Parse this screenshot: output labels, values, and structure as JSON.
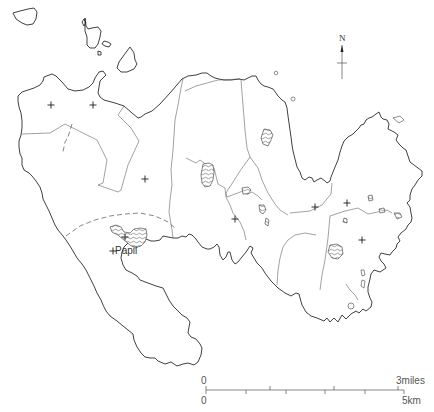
{
  "map": {
    "type": "outline map",
    "colors": {
      "line": "#2a2a2a",
      "background": "#ffffff"
    },
    "place_labels": [
      {
        "name": "Papil",
        "x": 119,
        "y": 251
      }
    ],
    "north_arrow": {
      "label": "N",
      "x": 342,
      "y": 40
    },
    "scale_bar": {
      "top_start_label": "0",
      "top_end_label": "3miles",
      "bottom_start_label": "0",
      "bottom_end_label": "5km"
    },
    "site_markers": [
      {
        "x": 51,
        "y": 105
      },
      {
        "x": 93,
        "y": 105
      },
      {
        "x": 145,
        "y": 179
      },
      {
        "x": 125,
        "y": 237
      },
      {
        "x": 113,
        "y": 251
      },
      {
        "x": 235,
        "y": 219
      },
      {
        "x": 315,
        "y": 207
      },
      {
        "x": 347,
        "y": 203
      },
      {
        "x": 362,
        "y": 240
      }
    ]
  }
}
